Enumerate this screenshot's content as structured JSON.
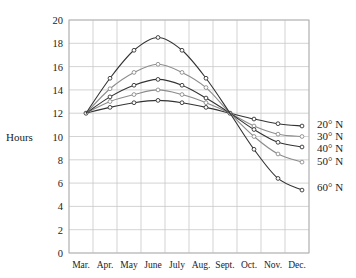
{
  "chart_data": {
    "type": "line",
    "title": "",
    "xlabel": "",
    "ylabel": "Hours",
    "categories": [
      "Mar.",
      "Apr.",
      "May",
      "June",
      "July",
      "Aug.",
      "Sept.",
      "Oct.",
      "Nov.",
      "Dec."
    ],
    "y_ticks": [
      "0",
      "2",
      "4",
      "6",
      "8",
      "10",
      "12",
      "14",
      "16",
      "18",
      "20"
    ],
    "ylim": [
      0,
      20
    ],
    "grid": true,
    "legend_position": "right, inline labels at line ends",
    "series": [
      {
        "name": "20° N",
        "color": "#333333",
        "values": [
          12,
          12.5,
          12.9,
          13.1,
          12.9,
          12.5,
          12,
          11.5,
          11.1,
          10.9
        ]
      },
      {
        "name": "30° N",
        "color": "#8c8c8c",
        "values": [
          12,
          13.0,
          13.6,
          14.0,
          13.6,
          12.9,
          12,
          10.9,
          10.2,
          10.0
        ]
      },
      {
        "name": "40° N",
        "color": "#333333",
        "values": [
          12,
          13.4,
          14.4,
          14.9,
          14.4,
          13.3,
          12,
          10.6,
          9.5,
          9.1
        ]
      },
      {
        "name": "50° N",
        "color": "#8c8c8c",
        "values": [
          12,
          14.1,
          15.5,
          16.2,
          15.5,
          14.2,
          12,
          10.0,
          8.5,
          7.8
        ]
      },
      {
        "name": "60° N",
        "color": "#333333",
        "values": [
          12,
          15.0,
          17.4,
          18.5,
          17.4,
          15.0,
          12,
          8.9,
          6.4,
          5.4
        ]
      }
    ]
  }
}
